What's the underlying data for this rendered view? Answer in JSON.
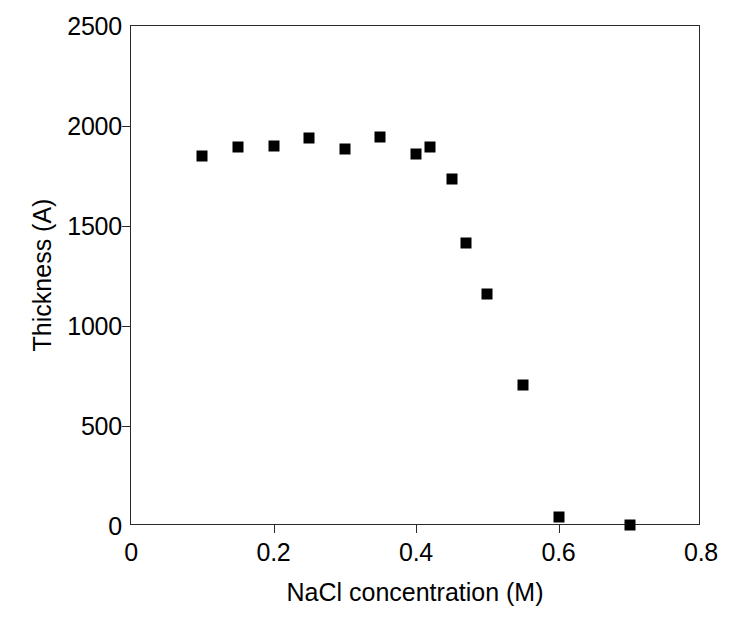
{
  "chart_data": {
    "type": "scatter",
    "title": "",
    "xlabel": "NaCl concentration (M)",
    "ylabel": "Thickness (A)",
    "xlim": [
      0,
      0.8
    ],
    "ylim": [
      0,
      2500
    ],
    "xticks": [
      "0",
      "0.2",
      "0.4",
      "0.6",
      "0.8"
    ],
    "xtick_values": [
      0,
      0.2,
      0.4,
      0.6,
      0.8
    ],
    "yticks": [
      "0",
      "500",
      "1000",
      "1500",
      "2000",
      "2500"
    ],
    "ytick_values": [
      0,
      500,
      1000,
      1500,
      2000,
      2500
    ],
    "grid": false,
    "legend": null,
    "marker": {
      "shape": "filled-square",
      "color": "#000000",
      "size_px": 11
    },
    "axis_color": "#2b2b2b",
    "background": "#ffffff",
    "series": [
      {
        "name": "Thickness",
        "x": [
          0.1,
          0.15,
          0.2,
          0.25,
          0.3,
          0.35,
          0.4,
          0.42,
          0.45,
          0.47,
          0.5,
          0.55,
          0.6,
          0.7
        ],
        "y": [
          1850,
          1895,
          1900,
          1940,
          1885,
          1945,
          1860,
          1895,
          1735,
          1415,
          1160,
          705,
          45,
          5
        ]
      }
    ]
  }
}
